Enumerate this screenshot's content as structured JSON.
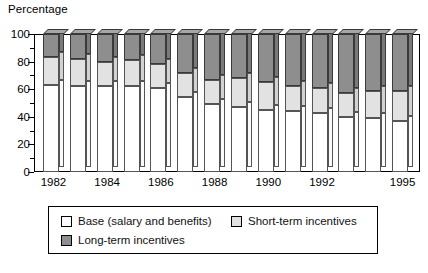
{
  "chart_data": {
    "type": "bar",
    "subtype": "stacked-bar-3d",
    "title": "",
    "ylabel": "Percentage",
    "xlabel": "",
    "ylim": [
      0,
      100
    ],
    "ytick_labels": [
      "0",
      "20",
      "40",
      "60",
      "80",
      "100"
    ],
    "ytick_values": [
      0,
      20,
      40,
      60,
      80,
      100
    ],
    "minor_tick_step": 10,
    "grid": false,
    "legend_position": "bottom",
    "categories": [
      "1982",
      "1983",
      "1984",
      "1985",
      "1986",
      "1987",
      "1988",
      "1989",
      "1990",
      "1991",
      "1992",
      "1993",
      "1994",
      "1995"
    ],
    "x_tick_labels_shown": [
      "1982",
      "1984",
      "1986",
      "1988",
      "1990",
      "1992",
      "1995"
    ],
    "series": [
      {
        "name": "Base (salary and benefits)",
        "color": "#ffffff",
        "values": [
          63,
          62,
          62,
          62,
          61,
          54,
          49,
          47,
          45,
          44,
          43,
          40,
          39,
          37
        ]
      },
      {
        "name": "Short-term incentives",
        "color": "#e2e2e2",
        "values": [
          20,
          20,
          18,
          19,
          17,
          18,
          18,
          21,
          20,
          18,
          18,
          17,
          20,
          22
        ]
      },
      {
        "name": "Long-term incentives",
        "color": "#8e8e8e",
        "values": [
          17,
          18,
          20,
          19,
          22,
          28,
          33,
          32,
          35,
          38,
          39,
          43,
          41,
          41
        ]
      }
    ]
  },
  "legend": {
    "items": [
      {
        "label": "Base (salary and benefits)",
        "swatch": "base"
      },
      {
        "label": "Short-term incentives",
        "swatch": "short"
      },
      {
        "label": "Long-term incentives",
        "swatch": "long"
      }
    ]
  }
}
